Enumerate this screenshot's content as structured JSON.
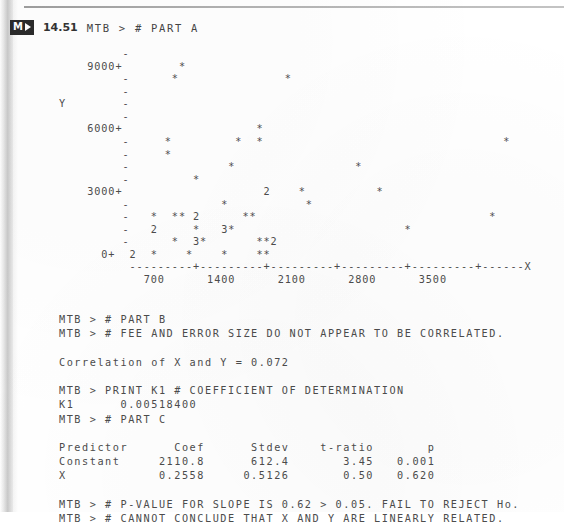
{
  "page": {
    "exercise_badge": "M",
    "exercise_number": "14.51",
    "header_command": "MTB > # PART A"
  },
  "chart_data": {
    "type": "scatter",
    "title": "",
    "xlabel": "X",
    "ylabel": "Y",
    "xlim": [
      0,
      4200
    ],
    "ylim": [
      0,
      9600
    ],
    "xticks": [
      700,
      1400,
      2100,
      2800,
      3500
    ],
    "yticks": [
      0,
      3000,
      6000,
      9000
    ],
    "ytick_labels": [
      "0+",
      "3000+",
      "6000+",
      "9000+"
    ],
    "grid": false,
    "legend": null,
    "plot_rows": [
      "         -",
      "    9000+        *",
      "         -      *               *",
      "         -",
      "         -",
      "         -",
      "    6000+                   *",
      "         -     *         *  *                                  *",
      "         -     *",
      "         -              *                 *",
      "         -         *",
      "    3000+                    2    *          *",
      "         -             *           *",
      "         -   *  ** 2      **                                 *",
      "         -   2     *   3*                        *",
      "         -      *  3*       **2",
      "      0+  2  *    *    *    **"
    ],
    "axis_line": "          ---------+---------+---------+---------+---------+------X",
    "xtick_label_row": "            700      1400      2100      2800      3500",
    "y_axis_label_text": "Y",
    "points_encoded": [
      {
        "row": 1,
        "marks": [
          {
            "col": 17,
            "glyph": "*"
          }
        ]
      },
      {
        "row": 2,
        "marks": [
          {
            "col": 16,
            "glyph": "*"
          },
          {
            "col": 32,
            "glyph": "*"
          }
        ]
      },
      {
        "row": 6,
        "marks": [
          {
            "col": 28,
            "glyph": "*"
          }
        ]
      },
      {
        "row": 7,
        "marks": [
          {
            "col": 15,
            "glyph": "*"
          },
          {
            "col": 25,
            "glyph": "*"
          },
          {
            "col": 28,
            "glyph": "*"
          },
          {
            "col": 63,
            "glyph": "*"
          }
        ]
      },
      {
        "row": 8,
        "marks": [
          {
            "col": 15,
            "glyph": "*"
          }
        ]
      },
      {
        "row": 9,
        "marks": [
          {
            "col": 24,
            "glyph": "*"
          },
          {
            "col": 42,
            "glyph": "*"
          }
        ]
      },
      {
        "row": 10,
        "marks": [
          {
            "col": 19,
            "glyph": "*"
          }
        ]
      },
      {
        "row": 11,
        "marks": [
          {
            "col": 29,
            "glyph": "2"
          },
          {
            "col": 34,
            "glyph": "*"
          },
          {
            "col": 45,
            "glyph": "*"
          }
        ]
      },
      {
        "row": 12,
        "marks": [
          {
            "col": 23,
            "glyph": "*"
          },
          {
            "col": 35,
            "glyph": "*"
          }
        ]
      },
      {
        "row": 13,
        "marks": [
          {
            "col": 13,
            "glyph": "*"
          },
          {
            "col": 16,
            "glyph": "*"
          },
          {
            "col": 17,
            "glyph": "*"
          },
          {
            "col": 19,
            "glyph": "2"
          },
          {
            "col": 26,
            "glyph": "*"
          },
          {
            "col": 27,
            "glyph": "*"
          },
          {
            "col": 61,
            "glyph": "*"
          }
        ]
      },
      {
        "row": 14,
        "marks": [
          {
            "col": 13,
            "glyph": "2"
          },
          {
            "col": 19,
            "glyph": "*"
          },
          {
            "col": 23,
            "glyph": "3"
          },
          {
            "col": 24,
            "glyph": "*"
          },
          {
            "col": 50,
            "glyph": "*"
          }
        ]
      },
      {
        "row": 15,
        "marks": [
          {
            "col": 16,
            "glyph": "*"
          },
          {
            "col": 19,
            "glyph": "3"
          },
          {
            "col": 20,
            "glyph": "*"
          },
          {
            "col": 28,
            "glyph": "*"
          },
          {
            "col": 29,
            "glyph": "*"
          },
          {
            "col": 30,
            "glyph": "2"
          }
        ]
      },
      {
        "row": 16,
        "marks": [
          {
            "col": 10,
            "glyph": "2"
          },
          {
            "col": 13,
            "glyph": "*"
          },
          {
            "col": 18,
            "glyph": "*"
          },
          {
            "col": 23,
            "glyph": "*"
          },
          {
            "col": 28,
            "glyph": "*"
          },
          {
            "col": 29,
            "glyph": "*"
          }
        ]
      }
    ]
  },
  "output": {
    "lines": [
      "MTB > # PART B",
      "MTB > # FEE AND ERROR SIZE DO NOT APPEAR TO BE CORRELATED.",
      "",
      "Correlation of X and Y = 0.072",
      "",
      "MTB > PRINT K1 # COEFFICIENT OF DETERMINATION",
      "K1      0.00518400",
      "MTB > # PART C",
      "",
      "Predictor      Coef      Stdev    t-ratio       p",
      "Constant     2110.8      612.4       3.45   0.001",
      "X            0.2558     0.5126       0.50   0.620",
      "",
      "MTB > # P-VALUE FOR SLOPE IS 0.62 > 0.05. FAIL TO REJECT Ho.",
      "MTB > # CANNOT CONCLUDE THAT X AND Y ARE LINEARLY RELATED."
    ],
    "correlation": "0.072",
    "k1": "0.00518400",
    "table": {
      "headers": [
        "Predictor",
        "Coef",
        "Stdev",
        "t-ratio",
        "p"
      ],
      "rows": [
        [
          "Constant",
          "2110.8",
          "612.4",
          "3.45",
          "0.001"
        ],
        [
          "X",
          "0.2558",
          "0.5126",
          "0.50",
          "0.620"
        ]
      ]
    }
  }
}
